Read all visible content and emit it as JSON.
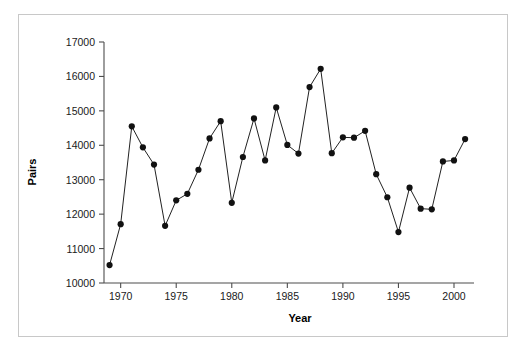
{
  "chart_data": {
    "type": "line",
    "title": "",
    "xlabel": "Year",
    "ylabel": "Pairs",
    "xlim": [
      1968.5,
      2001.8
    ],
    "ylim": [
      10000,
      17000
    ],
    "grid": false,
    "legend": null,
    "xticks": [
      1970,
      1975,
      1980,
      1985,
      1990,
      1995,
      2000
    ],
    "xtick_labels": [
      "1970",
      "1975",
      "1980",
      "1985",
      "1990",
      "1995",
      "2000"
    ],
    "yticks": [
      10000,
      11000,
      12000,
      13000,
      14000,
      15000,
      16000,
      17000
    ],
    "ytick_labels": [
      "10000",
      "11000",
      "12000",
      "13000",
      "14000",
      "15000",
      "16000",
      "17000"
    ],
    "marker": "filled-circle",
    "marker_color": "#111111",
    "line_color": "#222222",
    "x": [
      1969,
      1970,
      1971,
      1972,
      1973,
      1974,
      1975,
      1976,
      1977,
      1978,
      1979,
      1980,
      1981,
      1982,
      1983,
      1984,
      1985,
      1986,
      1987,
      1988,
      1989,
      1990,
      1991,
      1992,
      1993,
      1994,
      1995,
      1996,
      1997,
      1998,
      1999,
      2000,
      2001
    ],
    "values": [
      10520,
      11710,
      14550,
      13940,
      13440,
      11660,
      12400,
      12590,
      13290,
      14200,
      14700,
      12330,
      13660,
      14780,
      13560,
      15100,
      14010,
      13760,
      15690,
      16220,
      13770,
      14230,
      14220,
      14420,
      13160,
      12490,
      11480,
      12770,
      12160,
      12140,
      13530,
      13560,
      14180
    ]
  },
  "axis": {
    "y_title": "Pairs",
    "x_title": "Year"
  }
}
